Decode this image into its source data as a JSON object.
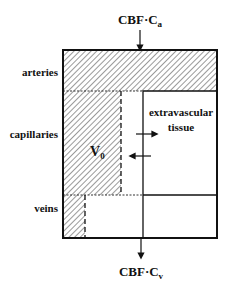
{
  "diagram": {
    "type": "compartment-model",
    "inflow": {
      "label_main": "CBF·C",
      "label_sub": "a"
    },
    "outflow": {
      "label_main": "CBF·C",
      "label_sub": "v"
    },
    "regions": {
      "arteries": "arteries",
      "capillaries": "capillaries",
      "veins": "veins"
    },
    "tissue": {
      "line1": "extravascular",
      "line2": "tissue"
    },
    "volume": {
      "label_main": "V",
      "label_sub": "0"
    },
    "caption_fragment": "...ic Diagram of the vascular compartments..."
  },
  "colors": {
    "line": "#111111",
    "hatch": "#555555",
    "background": "#ffffff"
  }
}
